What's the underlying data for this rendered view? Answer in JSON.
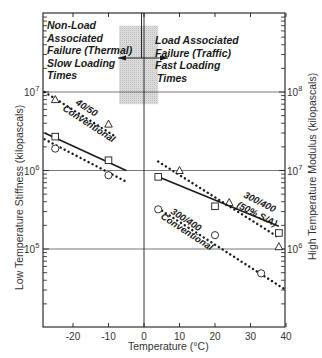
{
  "chart_data": {
    "type": "scatter",
    "title": "",
    "xlabel": "Temperature (°C)",
    "ylabel_left": "Low Temperature Stiffness (kilopascals)",
    "ylabel_right": "High Temperature Modulus (kilopascals)",
    "xlim": [
      -28,
      40
    ],
    "x_ticks": [
      -20,
      -10,
      0,
      10,
      20,
      30,
      40
    ],
    "ylim_left": [
      10000,
      100000000
    ],
    "ylim_right": [
      100000,
      1000000000
    ],
    "y_scale": "log",
    "y_ticks_left": [
      "10^5",
      "10^6",
      "10^7"
    ],
    "y_ticks_right": [
      "10^6",
      "10^7",
      "10^8"
    ],
    "gridlines": "horizontal at decades, vertical at 0 °C",
    "shaded_band": {
      "x_range": [
        -7,
        4
      ],
      "y_range_left_kPa": [
        7000000,
        70000000
      ],
      "color": "#d6d6d6"
    },
    "annotations": [
      {
        "text_lines": [
          "Non-Load",
          "Associated",
          "Failure (Thermal)",
          "Slow Loading",
          "Times"
        ],
        "position": "top-left"
      },
      {
        "text_lines": [
          "Load Associated",
          "Failure (Traffic)",
          "Fast Loading",
          "Times"
        ],
        "position": "top-right"
      }
    ],
    "series": [
      {
        "name": "40/50 Conventional (low temp)",
        "axis": "left",
        "marker": "triangle",
        "line": "dotted",
        "points": [
          [
            -25,
            8000000
          ],
          [
            -10,
            3900000
          ]
        ],
        "line_from": [
          -28,
          10000000
        ],
        "line_to": [
          -8,
          2700000
        ]
      },
      {
        "name": "300/400 (50% S/A) (low temp)",
        "axis": "left",
        "marker": "square",
        "line": "solid",
        "points": [
          [
            -25,
            2700000
          ],
          [
            -10,
            1350000
          ]
        ],
        "line_from": [
          -28,
          3000000
        ],
        "line_to": [
          -5,
          1000000
        ]
      },
      {
        "name": "300/400 Conventional (low temp)",
        "axis": "left",
        "marker": "circle",
        "line": "dotted",
        "points": [
          [
            -25,
            1900000
          ],
          [
            -10,
            870000
          ]
        ],
        "line_from": [
          -28,
          2500000
        ],
        "line_to": [
          -5,
          720000
        ]
      },
      {
        "name": "40/50 Conventional (high temp)",
        "axis": "right",
        "marker": "triangle",
        "line": "dotted",
        "points": [
          [
            10,
            10000000
          ],
          [
            24,
            3900000
          ],
          [
            38,
            1070000
          ]
        ],
        "line_from": [
          4,
          13000000
        ],
        "line_to": [
          38,
          1400000
        ]
      },
      {
        "name": "300/400 (50% S/A) (high temp)",
        "axis": "right",
        "marker": "square",
        "line": "solid",
        "points": [
          [
            4,
            8300000
          ],
          [
            20,
            3500000
          ],
          [
            38,
            1600000
          ]
        ],
        "line_from": [
          4,
          8300000
        ],
        "line_to": [
          38,
          1950000
        ]
      },
      {
        "name": "300/400 Conventional (high temp)",
        "axis": "right",
        "marker": "circle",
        "line": "dotted",
        "points": [
          [
            4,
            3200000
          ],
          [
            20,
            1500000
          ],
          [
            33,
            490000
          ]
        ],
        "line_from": [
          4,
          3300000
        ],
        "line_to": [
          40,
          300000
        ]
      }
    ],
    "series_labels": [
      {
        "text": "40/50",
        "near": "upper-left dotted line"
      },
      {
        "text": "Conventional",
        "near": "upper-left dotted line"
      },
      {
        "text": "300/400",
        "near": "right solid line"
      },
      {
        "text": "(50% S/A)",
        "near": "right solid line"
      },
      {
        "text": "300/400",
        "near": "right lower dotted line"
      },
      {
        "text": "Conventional",
        "near": "right lower dotted line"
      }
    ]
  },
  "labels": {
    "xlabel": "Temperature (°C)",
    "ylabel_left": "Low Temperature Stiffness (kilopascals)",
    "ylabel_right": "High Temperature Modulus (kilopascals)",
    "annot_left": [
      "Non-Load",
      "Associated",
      "Failure (Thermal)",
      "Slow Loading",
      "Times"
    ],
    "annot_right": [
      "Load Associated",
      "Failure (Traffic)",
      "Fast Loading",
      "Times"
    ],
    "x_ticks": [
      "-20",
      "-10",
      "0",
      "10",
      "20",
      "30",
      "40"
    ],
    "y_left_exp": [
      "7",
      "6",
      "5"
    ],
    "y_right_exp": [
      "8",
      "7",
      "6"
    ],
    "series_text": {
      "s4050_a": "40/50",
      "s4050_b": "Conventional",
      "s300sa_a": "300/400",
      "s300sa_b": "(50% S/A)",
      "s300c_a": "300/400",
      "s300c_b": "Conventional"
    }
  },
  "colors": {
    "ink": "#1a1a1a",
    "grid": "#555555",
    "band": "#d4d4d4"
  }
}
